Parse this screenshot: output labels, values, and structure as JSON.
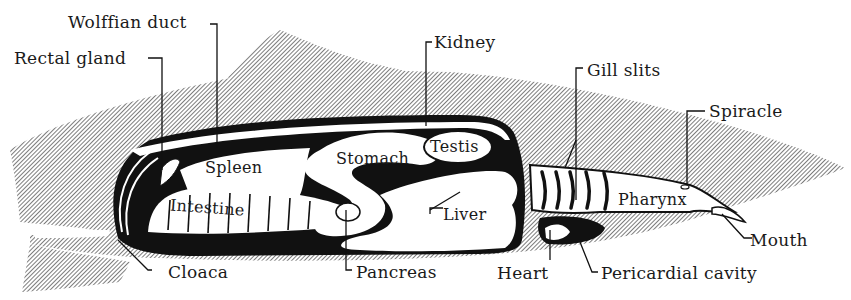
{
  "figure": {
    "colors": {
      "hatch": "#8a8a8a",
      "ink": "#111111",
      "background": "#ffffff",
      "organ_fill": "#ffffff"
    }
  },
  "labels": {
    "wolffian_duct": "Wolffian duct",
    "rectal_gland": "Rectal gland",
    "kidney": "Kidney",
    "gill_slits": "Gill slits",
    "spiracle": "Spiracle",
    "spleen": "Spleen",
    "stomach": "Stomach",
    "testis": "Testis",
    "intestine": "Intestine",
    "liver": "Liver",
    "pharynx": "Pharynx",
    "mouth": "Mouth",
    "cloaca": "Cloaca",
    "pancreas": "Pancreas",
    "heart": "Heart",
    "pericardial_cavity": "Pericardial cavity"
  }
}
